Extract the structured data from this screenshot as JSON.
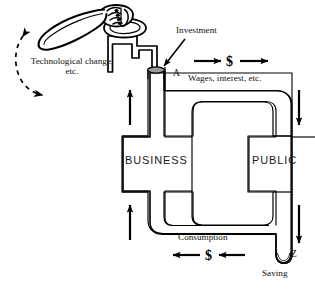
{
  "figure": {
    "type": "diagram",
    "background_color": "#ffffff",
    "line_color": "#000000",
    "pipe_fill_color": "#ffffff",
    "pump_opening_color": "#9a9a9a"
  },
  "labels": {
    "technological_change": "Technological change, etc.",
    "investment": "Investment",
    "point_a": "A",
    "wages": "Wages, interest, etc.",
    "consumption": "Consumption",
    "saving": "Saving",
    "point_z": "Z",
    "dollar_top": "$",
    "dollar_bottom": "$"
  },
  "tanks": [
    {
      "id": "business",
      "label": "BUSINESS"
    },
    {
      "id": "public",
      "label": "PUBLIC"
    }
  ],
  "flows": [
    {
      "id": "investment-inflow",
      "from": "pump",
      "to": "A",
      "direction": "down",
      "label": "Investment"
    },
    {
      "id": "wages-flow",
      "from": "A",
      "to": "public",
      "direction": "right",
      "label": "Wages, interest, etc."
    },
    {
      "id": "consumption-flow",
      "from": "public",
      "to": "business",
      "direction": "left",
      "label": "Consumption"
    },
    {
      "id": "saving-outflow",
      "from": "public",
      "to": "Z",
      "direction": "down",
      "label": "Saving"
    },
    {
      "id": "business-riser-top",
      "direction": "up"
    },
    {
      "id": "business-riser-bottom",
      "direction": "up"
    },
    {
      "id": "public-downcomer-top",
      "direction": "down"
    },
    {
      "id": "public-downcomer-bottom",
      "direction": "down"
    }
  ],
  "pump": {
    "id": "hand-pump",
    "motion_label": "Technological change, etc.",
    "motion": "two-way dashed arc arrow"
  }
}
